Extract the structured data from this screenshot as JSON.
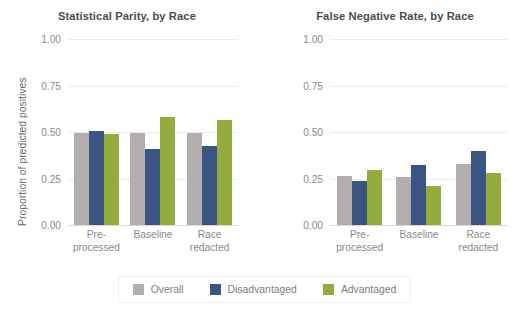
{
  "chart_data": [
    {
      "type": "bar",
      "title": "Statistical Parity, by Race",
      "xlabel": "",
      "ylabel": "Proportion of predicted positives",
      "categories": [
        "Pre-\nprocessed",
        "Baseline",
        "Race\nredacted"
      ],
      "category_lines": [
        [
          "Pre-",
          "processed"
        ],
        [
          "Baseline",
          ""
        ],
        [
          "Race",
          "redacted"
        ]
      ],
      "yticks": [
        "0.00",
        "0.25",
        "0.50",
        "0.75",
        "1.00"
      ],
      "ytick_values": [
        0.0,
        0.25,
        0.5,
        0.75,
        1.0
      ],
      "ylim": [
        0,
        1
      ],
      "grid": true,
      "legend_position": "bottom-center",
      "series": [
        {
          "name": "Overall",
          "color": "#b5aeae",
          "values": [
            0.495,
            0.497,
            0.495
          ]
        },
        {
          "name": "Disadvantaged",
          "color": "#3b5583",
          "values": [
            0.505,
            0.41,
            0.425
          ]
        },
        {
          "name": "Advantaged",
          "color": "#94ac3e",
          "values": [
            0.49,
            0.58,
            0.565
          ]
        }
      ]
    },
    {
      "type": "bar",
      "title": "False Negative Rate, by Race",
      "xlabel": "",
      "ylabel": "Proportion of false negatives",
      "categories": [
        "Pre-\nprocessed",
        "Baseline",
        "Race\nredacted"
      ],
      "category_lines": [
        [
          "Pre-",
          "processed"
        ],
        [
          "Baseline",
          ""
        ],
        [
          "Race",
          "redacted"
        ]
      ],
      "yticks": [
        "0.00",
        "0.25",
        "0.50",
        "0.75",
        "1.00"
      ],
      "ytick_values": [
        0.0,
        0.25,
        0.5,
        0.75,
        1.0
      ],
      "ylim": [
        0,
        1
      ],
      "grid": true,
      "legend_position": "bottom-center",
      "series": [
        {
          "name": "Overall",
          "color": "#b5aeae",
          "values": [
            0.265,
            0.26,
            0.33
          ]
        },
        {
          "name": "Disadvantaged",
          "color": "#3b5583",
          "values": [
            0.235,
            0.325,
            0.4
          ]
        },
        {
          "name": "Advantaged",
          "color": "#94ac3e",
          "values": [
            0.295,
            0.21,
            0.28
          ]
        }
      ]
    }
  ],
  "legend": {
    "items": [
      {
        "label": "Overall",
        "color": "#b5aeae"
      },
      {
        "label": "Disadvantaged",
        "color": "#3b5583"
      },
      {
        "label": "Advantaged",
        "color": "#94ac3e"
      }
    ]
  }
}
